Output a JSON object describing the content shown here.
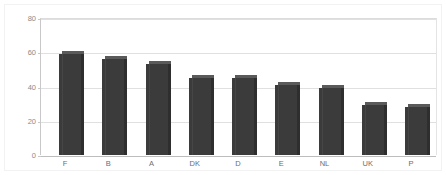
{
  "chart_data": {
    "type": "bar",
    "title": "",
    "subtitle": "",
    "xlabel": "",
    "ylabel": "",
    "categories": [
      "F",
      "B",
      "A",
      "DK",
      "D",
      "E",
      "NL",
      "UK",
      "P"
    ],
    "values": [
      59,
      56,
      53,
      45,
      45,
      41,
      39,
      29,
      28
    ],
    "series": [
      {
        "name": "",
        "values": [
          59,
          56,
          53,
          45,
          45,
          41,
          39,
          29,
          28
        ]
      }
    ],
    "ylim": [
      0,
      80
    ],
    "yticks": [
      0,
      20,
      40,
      60,
      80
    ],
    "ytick_labels": [
      "0",
      "20",
      "40",
      "60",
      "80"
    ],
    "grid": true,
    "grid_axis": "y",
    "legend": false,
    "legend_position": "none",
    "style": "3d-column",
    "bar_color": "#3b3b3b",
    "bar_top_color": "#5a5a5a",
    "bar_side_color": "#2e2e2e",
    "gridline_color": "#e0e0e0",
    "axis_color": "#c8c8c8",
    "background_color": "#ffffff",
    "tick_label_color": "#8a8a8a"
  }
}
